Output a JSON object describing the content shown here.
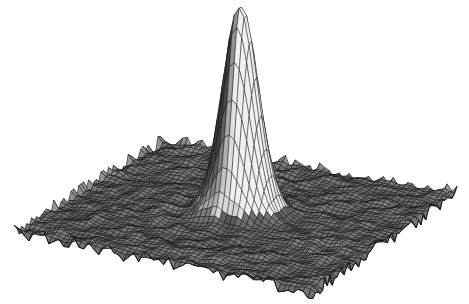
{
  "chart_data": {
    "type": "surface",
    "title": "",
    "xlabel": "",
    "ylabel": "",
    "zlabel": "",
    "grid": false,
    "axes_visible": false,
    "legend": null,
    "surface": {
      "function": "z = exp(-(x^2 + y^2) / (2 * sigma^2)) + noise",
      "x_range": [
        -1,
        1
      ],
      "y_range": [
        -1,
        1
      ],
      "z_range": [
        0,
        1
      ],
      "peak": {
        "x": 0.0,
        "y": -0.05,
        "z": 1.0
      },
      "sigma": 0.11,
      "base_noise_amplitude": 0.012,
      "mesh_resolution": 60
    },
    "projection": {
      "corners_px": {
        "back": [
          163,
          140
        ],
        "right": [
          457,
          193
        ],
        "front": [
          313,
          292
        ],
        "left": [
          14,
          232
        ]
      },
      "peak_height_px": 206
    },
    "colors": {
      "background": "#ffffff",
      "mesh_dark": "#1a1a1a",
      "mesh_mid": "#3a3a3a",
      "highlight": "#f2f2f2"
    }
  }
}
